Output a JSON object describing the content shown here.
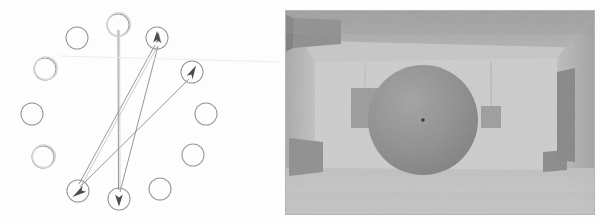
{
  "figure": {
    "title": "",
    "background_color": "#fefefe",
    "panels": [
      {
        "id": "node-arrow-diagram",
        "label": ""
      },
      {
        "id": "rendered-room-image",
        "label": ""
      }
    ]
  },
  "left_panel": {
    "name": "node-arrow-diagram",
    "stroke_color": "#8c8c8c",
    "arrow_color": "#6e6e6e",
    "node_radius": 11,
    "node_count": 12,
    "nodes": [
      {
        "id": "n1",
        "cx": 118,
        "cy": 25,
        "marker": "none",
        "label": ""
      },
      {
        "id": "n2",
        "cx": 157,
        "cy": 38,
        "marker": "arrow-up",
        "label": ""
      },
      {
        "id": "n3",
        "cx": 192,
        "cy": 72,
        "marker": "arrow-up",
        "label": ""
      },
      {
        "id": "n4",
        "cx": 206,
        "cy": 114,
        "marker": "none",
        "label": ""
      },
      {
        "id": "n5",
        "cx": 193,
        "cy": 155,
        "marker": "none",
        "label": ""
      },
      {
        "id": "n6",
        "cx": 160,
        "cy": 189,
        "marker": "none",
        "label": ""
      },
      {
        "id": "n7",
        "cx": 119,
        "cy": 199,
        "marker": "arrow-down",
        "label": ""
      },
      {
        "id": "n8",
        "cx": 78,
        "cy": 191,
        "marker": "arrow-down",
        "label": ""
      },
      {
        "id": "n9",
        "cx": 43,
        "cy": 157,
        "marker": "none",
        "label": ""
      },
      {
        "id": "n10",
        "cx": 32,
        "cy": 114,
        "marker": "none",
        "label": ""
      },
      {
        "id": "n11",
        "cx": 45,
        "cy": 69,
        "marker": "none",
        "label": ""
      },
      {
        "id": "n12",
        "cx": 77,
        "cy": 38,
        "marker": "none",
        "label": ""
      }
    ],
    "edges": [
      {
        "from": "n1",
        "to": "n7",
        "tip": "down"
      },
      {
        "from": "n8",
        "to": "n2",
        "tip": "up"
      },
      {
        "from": "n7",
        "to": "n2",
        "tip": "up"
      },
      {
        "from": "n8",
        "to": "n3",
        "tip": "up"
      }
    ]
  },
  "right_panel": {
    "name": "rendered-room-image",
    "description": "grayscale rendered interior room with centered sphere",
    "border_color": "#b9b9b9",
    "tones": {
      "ceiling": "#a9a9a9",
      "back_wall": "#c9c9c9",
      "left_wall": "#b4b4b4",
      "right_wall": "#b0b0b0",
      "floor": "#c4c4c4",
      "sphere": "#8e8e8e",
      "box_dark": "#8a8a8a",
      "box_mid": "#9c9c9c",
      "highlight": "#d8d8d8"
    },
    "objects": [
      {
        "id": "sphere-center",
        "shape": "sphere",
        "tone": "#8e8e8e"
      },
      {
        "id": "box-back-left",
        "shape": "box",
        "tone": "#999999"
      },
      {
        "id": "box-back-right",
        "shape": "box",
        "tone": "#9e9e9e"
      },
      {
        "id": "box-ceiling-left",
        "shape": "box",
        "tone": "#8b8b8b"
      },
      {
        "id": "box-floor-left",
        "shape": "box",
        "tone": "#8d8d8d"
      },
      {
        "id": "box-floor-right",
        "shape": "box",
        "tone": "#8f8f8f"
      },
      {
        "id": "pillar-right",
        "shape": "box",
        "tone": "#868686"
      }
    ],
    "center_marker": {
      "cx": 0.5,
      "cy": 0.5,
      "color": "#2a2a2a"
    }
  }
}
